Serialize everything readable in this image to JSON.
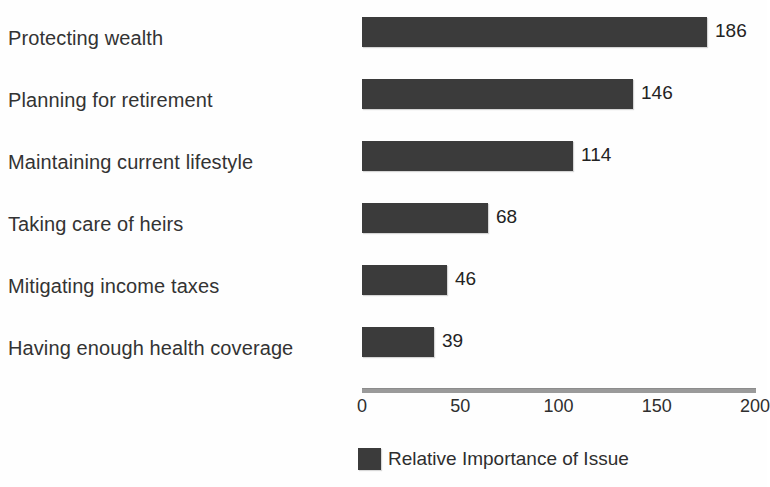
{
  "chart_data": {
    "type": "bar",
    "orientation": "horizontal",
    "title": "",
    "xlabel": "",
    "ylabel": "",
    "categories": [
      "Protecting wealth",
      "Planning for retirement",
      "Maintaining current lifestyle",
      "Taking care of heirs",
      "Mitigating income taxes",
      "Having enough health coverage"
    ],
    "values": [
      186,
      146,
      114,
      68,
      46,
      39
    ],
    "series": [
      {
        "name": "Relative Importance of Issue",
        "values": [
          186,
          146,
          114,
          68,
          46,
          39
        ]
      }
    ],
    "value_labels": [
      "186",
      "146",
      "114",
      "68",
      "46",
      "39"
    ],
    "xticks": [
      0,
      50,
      100,
      150,
      200
    ],
    "xtick_labels": [
      "0",
      "50",
      "100",
      "150",
      "200"
    ],
    "xlim": [
      0,
      200
    ],
    "grid": false,
    "legend_position": "bottom",
    "legend_entries": [
      "Relative Importance of Issue"
    ],
    "bar_color": "#3b3b3b",
    "axis_color": "#9a9a9a",
    "background_color": "#fefefe",
    "text_color": "#2e2e2e"
  },
  "legend": {
    "label": "Relative Importance of Issue"
  },
  "axis": {
    "ticks": [
      "0",
      "50",
      "100",
      "150",
      "200"
    ]
  }
}
